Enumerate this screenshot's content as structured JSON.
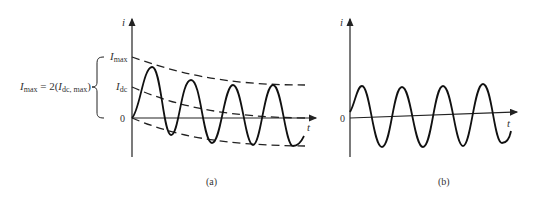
{
  "panel_a": {
    "caption": "(a)",
    "axis_y_label": "i",
    "axis_x_label": "t",
    "origin_label": "0",
    "imax_label": "I",
    "imax_sub": "max",
    "idc_label": "I",
    "idc_sub": "dc",
    "equation": {
      "lhs": "I",
      "lhs_sub": "max",
      "mid": " = 2(",
      "rhs": "I",
      "rhs_sub": "dc, max",
      "end": ")"
    },
    "description": "Asymmetrical fault current with decaying DC offset; dashed envelopes and DC component"
  },
  "panel_b": {
    "caption": "(b)",
    "axis_y_label": "i",
    "axis_x_label": "t",
    "origin_label": "0",
    "description": "Symmetrical AC current"
  },
  "colors": {
    "ink": "#222222",
    "text": "#333333"
  }
}
